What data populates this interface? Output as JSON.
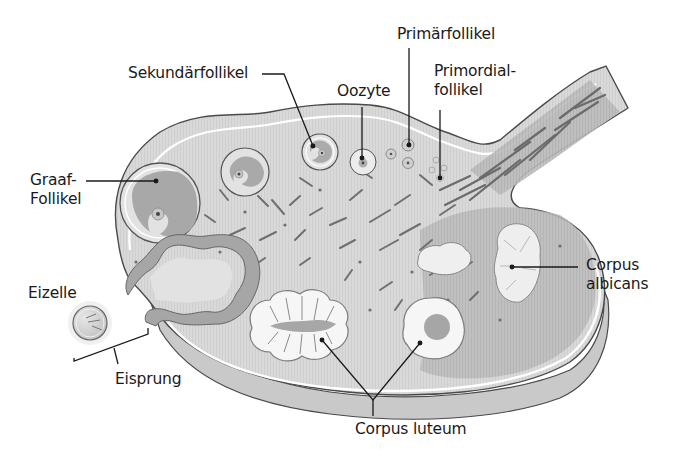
{
  "diagram": {
    "language": "de",
    "colors": {
      "stroma_light": "#dcdcdc",
      "stroma_dark": "#b9b9b9",
      "follicle_fill": "#a9a9a9",
      "outline": "#4a4a4a",
      "corpus_fill": "#f4f4f4",
      "text": "#1a1a1a"
    },
    "labels": {
      "sekundaerfollikel": "Sekundärfollikel",
      "primaerfollikel": "Primärfollikel",
      "oozyte": "Oozyte",
      "primordial_line1": "Primordial-",
      "primordial_line2": "follikel",
      "graaf_line1": "Graaf-",
      "graaf_line2": "Follikel",
      "eizelle": "Eizelle",
      "eisprung": "Eisprung",
      "corpus_albicans_line1": "Corpus",
      "corpus_albicans_line2": "albicans",
      "corpus_luteum": "Corpus luteum"
    }
  }
}
